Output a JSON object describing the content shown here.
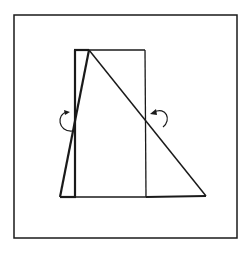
{
  "diagram": {
    "colors": {
      "stroke": "#1a1a1a",
      "background": "#ffffff"
    },
    "frame": {
      "x": 14,
      "y": 15,
      "w": 223,
      "h": 223
    },
    "rectangle": {
      "x1": 75,
      "y1": 50,
      "x2": 145,
      "y2": 197
    },
    "triangle": {
      "apex": [
        89,
        50
      ],
      "base_left": [
        60,
        197
      ],
      "base_right": [
        206,
        197
      ]
    },
    "arrows": [
      {
        "name": "left-rotation-arrow",
        "cx": 66,
        "cy": 122
      },
      {
        "name": "right-rotation-arrow",
        "cx": 158,
        "cy": 118
      }
    ]
  }
}
